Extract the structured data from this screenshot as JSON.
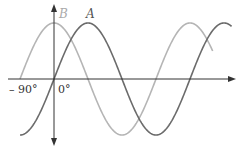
{
  "chart_data": {
    "type": "line",
    "title": "",
    "xlabel": "",
    "ylabel": "",
    "x_tick_labels": [
      "– 90°",
      "0°"
    ],
    "series": [
      {
        "name": "A",
        "function": "sin(x)",
        "x_start_deg": -90,
        "x_end_deg": 470,
        "color": "#6b6b6b"
      },
      {
        "name": "B",
        "function": "cos(x)",
        "x_start_deg": -90,
        "x_end_deg": 420,
        "color": "#b5b5b5"
      }
    ],
    "grid": false,
    "legend": "inline labels"
  },
  "labels": {
    "curve_a": "A",
    "curve_b": "B",
    "tick_neg90": "– 90°",
    "tick_0": "0°"
  },
  "colors": {
    "axis": "#333333",
    "curve_a": "#6b6b6b",
    "curve_b": "#b5b5b5",
    "label_a": "#555555",
    "label_b": "#aaaaaa"
  }
}
